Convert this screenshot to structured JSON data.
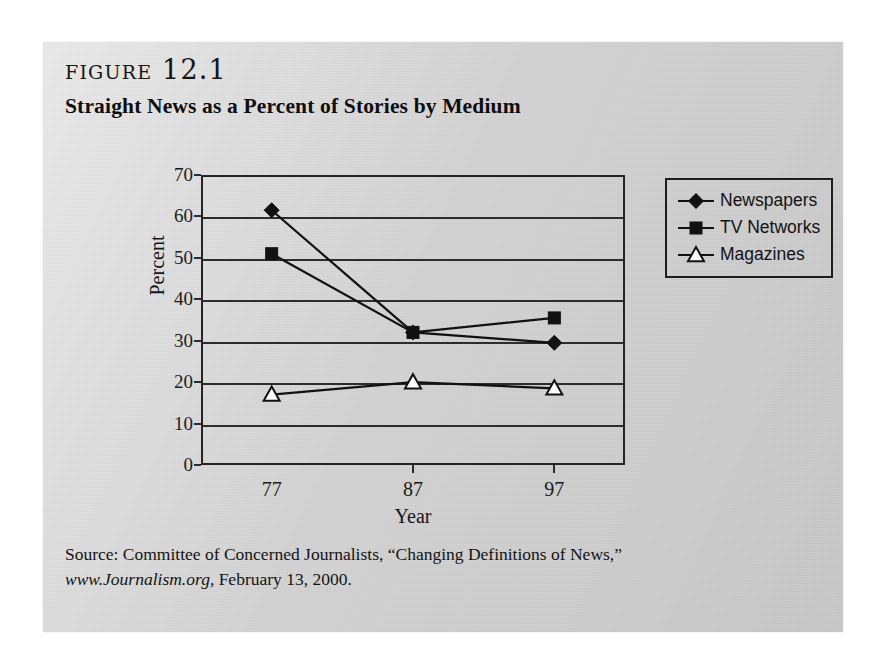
{
  "figure": {
    "number_label": "Figure 12.1",
    "title": "Straight News as a Percent of Stories by Medium"
  },
  "source": {
    "line1": "Source: Committee of Concerned Journalists, “Changing Definitions of News,”",
    "url_text": "www.Journalism.org,",
    "line2_rest": " February 13, 2000."
  },
  "chart_data": {
    "type": "line",
    "title": "Straight News as a Percent of Stories by Medium",
    "xlabel": "Year",
    "ylabel": "Percent",
    "categories": [
      "77",
      "87",
      "97"
    ],
    "x_tick_labels": [
      "77",
      "87",
      "97"
    ],
    "y_tick_labels": [
      "0",
      "10",
      "20",
      "30",
      "40",
      "50",
      "60",
      "70"
    ],
    "ylim": [
      0,
      70
    ],
    "y_tick_step": 10,
    "grid": true,
    "legend_position": "right",
    "series": [
      {
        "name": "Newspapers",
        "marker": "filled-diamond",
        "color": "#111111",
        "values": [
          61.5,
          32.0,
          29.5
        ]
      },
      {
        "name": "TV Networks",
        "marker": "filled-square",
        "color": "#111111",
        "values": [
          51.0,
          32.0,
          35.5
        ]
      },
      {
        "name": "Magazines",
        "marker": "open-triangle",
        "color": "#111111",
        "values": [
          17.0,
          20.0,
          18.5
        ]
      }
    ]
  }
}
